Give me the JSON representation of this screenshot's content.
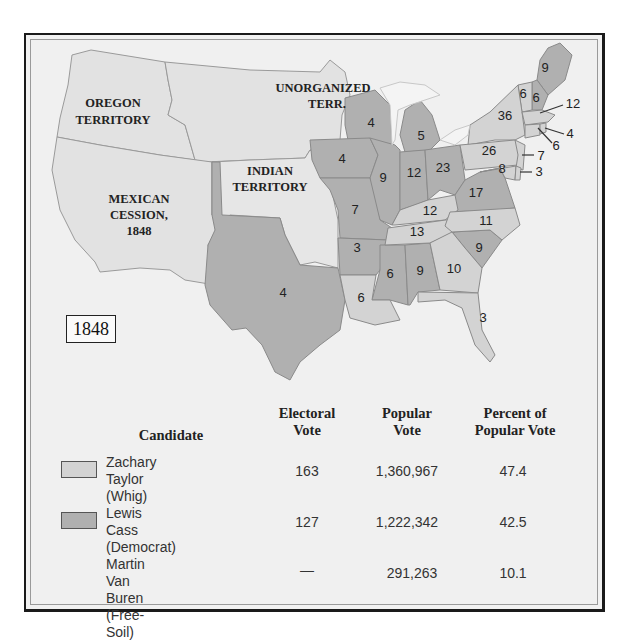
{
  "map": {
    "year_label": "1848",
    "colors": {
      "whig": "#d3d3d3",
      "democrat": "#b0b0b0",
      "territory": "#e2e2e2",
      "water": "#f2f2f2",
      "background": "#f0f0f0"
    },
    "territory_labels": {
      "oregon": [
        "OREGON",
        "TERRITORY"
      ],
      "unorganized": [
        "UNORGANIZED",
        "TERR."
      ],
      "indian": [
        "INDIAN",
        "TERRITORY"
      ],
      "mexican": [
        "MEXICAN",
        "CESSION,",
        "1848"
      ]
    },
    "states": [
      {
        "name": "Maine",
        "party": "democrat",
        "ev": "9"
      },
      {
        "name": "New Hampshire",
        "party": "democrat",
        "ev": "6"
      },
      {
        "name": "Vermont",
        "party": "whig",
        "ev": "6"
      },
      {
        "name": "Massachusetts",
        "party": "whig",
        "ev": "12"
      },
      {
        "name": "Rhode Island",
        "party": "whig",
        "ev": "4"
      },
      {
        "name": "Connecticut",
        "party": "whig",
        "ev": "6"
      },
      {
        "name": "New York",
        "party": "whig",
        "ev": "36"
      },
      {
        "name": "New Jersey",
        "party": "whig",
        "ev": "7"
      },
      {
        "name": "Pennsylvania",
        "party": "whig",
        "ev": "26"
      },
      {
        "name": "Delaware",
        "party": "whig",
        "ev": "3"
      },
      {
        "name": "Maryland",
        "party": "whig",
        "ev": "8"
      },
      {
        "name": "Virginia",
        "party": "democrat",
        "ev": "17"
      },
      {
        "name": "North Carolina",
        "party": "whig",
        "ev": "11"
      },
      {
        "name": "South Carolina",
        "party": "democrat",
        "ev": "9"
      },
      {
        "name": "Georgia",
        "party": "whig",
        "ev": "10"
      },
      {
        "name": "Florida",
        "party": "whig",
        "ev": "3"
      },
      {
        "name": "Alabama",
        "party": "democrat",
        "ev": "9"
      },
      {
        "name": "Mississippi",
        "party": "democrat",
        "ev": "6"
      },
      {
        "name": "Louisiana",
        "party": "whig",
        "ev": "6"
      },
      {
        "name": "Tennessee",
        "party": "whig",
        "ev": "13"
      },
      {
        "name": "Kentucky",
        "party": "whig",
        "ev": "12"
      },
      {
        "name": "Ohio",
        "party": "democrat",
        "ev": "23"
      },
      {
        "name": "Indiana",
        "party": "democrat",
        "ev": "12"
      },
      {
        "name": "Illinois",
        "party": "democrat",
        "ev": "9"
      },
      {
        "name": "Michigan",
        "party": "democrat",
        "ev": "5"
      },
      {
        "name": "Wisconsin",
        "party": "democrat",
        "ev": "4"
      },
      {
        "name": "Iowa",
        "party": "democrat",
        "ev": "4"
      },
      {
        "name": "Missouri",
        "party": "democrat",
        "ev": "7"
      },
      {
        "name": "Arkansas",
        "party": "democrat",
        "ev": "3"
      },
      {
        "name": "Texas",
        "party": "democrat",
        "ev": "4"
      }
    ]
  },
  "table": {
    "headers": {
      "candidate": "Candidate",
      "electoral": [
        "Electoral",
        "Vote"
      ],
      "popular": [
        "Popular",
        "Vote"
      ],
      "percent": [
        "Percent of",
        "Popular Vote"
      ]
    },
    "rows": [
      {
        "name": "Zachary Taylor",
        "party": "(Whig)",
        "swatch": "whig",
        "electoral": "163",
        "popular": "1,360,967",
        "percent": "47.4"
      },
      {
        "name": "Lewis Cass",
        "party": "(Democrat)",
        "swatch": "democrat",
        "electoral": "127",
        "popular": "1,222,342",
        "percent": "42.5"
      },
      {
        "name": "Martin Van Buren",
        "party": "(Free-Soil)",
        "swatch": "none",
        "electoral": "—",
        "popular": "291,263",
        "percent": "10.1"
      }
    ]
  }
}
